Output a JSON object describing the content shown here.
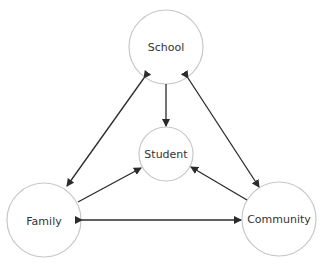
{
  "diagram": {
    "type": "relationship-triangle",
    "colors": {
      "node_stroke": "#c8c8c8",
      "edge": "#2b2b2b",
      "text": "#333333"
    },
    "nodes": [
      {
        "id": "school",
        "label": "School",
        "cx": 166,
        "cy": 47,
        "r": 37
      },
      {
        "id": "student",
        "label": "Student",
        "cx": 166,
        "cy": 154,
        "r": 27
      },
      {
        "id": "family",
        "label": "Family",
        "cx": 44,
        "cy": 220,
        "r": 37
      },
      {
        "id": "community",
        "label": "Community",
        "cx": 279,
        "cy": 219,
        "r": 37
      }
    ],
    "edges": [
      {
        "from": "school",
        "to": "student",
        "direction": "one-way"
      },
      {
        "from": "family",
        "to": "student",
        "direction": "one-way"
      },
      {
        "from": "community",
        "to": "student",
        "direction": "one-way"
      },
      {
        "from": "school",
        "to": "family",
        "direction": "two-way"
      },
      {
        "from": "school",
        "to": "community",
        "direction": "two-way"
      },
      {
        "from": "family",
        "to": "community",
        "direction": "two-way"
      }
    ]
  }
}
